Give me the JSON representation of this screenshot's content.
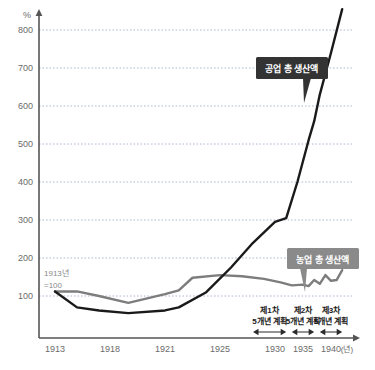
{
  "chart_data": {
    "type": "line",
    "title": "",
    "xlabel": "(년)",
    "ylabel": "%",
    "ylim": [
      0,
      870
    ],
    "xlim": [
      1913,
      1942
    ],
    "grid": true,
    "legend_position": "inline-callout",
    "y_ticks": [
      100,
      200,
      300,
      400,
      500,
      600,
      700,
      800
    ],
    "x_ticks": [
      1913,
      1918,
      1921,
      1925,
      1930,
      1935,
      1940
    ],
    "base_note": "1913년\n=100",
    "base_note_line1": "1913년",
    "base_note_line2": "=100",
    "series": [
      {
        "name": "공업 총 생산액",
        "color": "#1a1a1a",
        "x": [
          1913,
          1915,
          1917,
          1919,
          1921,
          1922,
          1924,
          1926,
          1928,
          1930,
          1932,
          1934,
          1936,
          1937,
          1938,
          1940,
          1942
        ],
        "values": [
          112,
          70,
          62,
          55,
          62,
          70,
          110,
          175,
          240,
          295,
          305,
          400,
          510,
          560,
          630,
          740,
          855
        ]
      },
      {
        "name": "농업 총 생산액",
        "color": "#7d7d7d",
        "x": [
          1913,
          1915,
          1917,
          1919,
          1921,
          1922,
          1923,
          1925,
          1927,
          1929,
          1931,
          1933,
          1935,
          1936,
          1937,
          1938,
          1939,
          1940,
          1941,
          1942
        ],
        "values": [
          112,
          112,
          100,
          82,
          105,
          115,
          148,
          155,
          152,
          145,
          136,
          128,
          130,
          126,
          142,
          132,
          155,
          140,
          142,
          168
        ]
      }
    ],
    "annotations": [
      {
        "name": "industrial-callout",
        "label": "공업 총 생산액",
        "style": "dark-box"
      },
      {
        "name": "agricultural-callout",
        "label": "농업 총 생산액",
        "style": "gray-box"
      }
    ],
    "plan_brackets": [
      {
        "line1": "제1차",
        "line2": "5개년 계획",
        "start_year": 1928,
        "end_year": 1932
      },
      {
        "line1": "제2차",
        "line2": "5개년 계획",
        "start_year": 1933,
        "end_year": 1937
      },
      {
        "line1": "제3차",
        "line2": "5개년 계획",
        "start_year": 1938,
        "end_year": 1942
      }
    ],
    "colors": {
      "industrial": "#1a1a1a",
      "agricultural": "#7d7d7d",
      "grid": "#9aa8c4",
      "axis": "#555555",
      "tick_text": "#6b6b6b",
      "callout_dark": "#333333",
      "callout_gray": "#8a8a8a"
    }
  }
}
